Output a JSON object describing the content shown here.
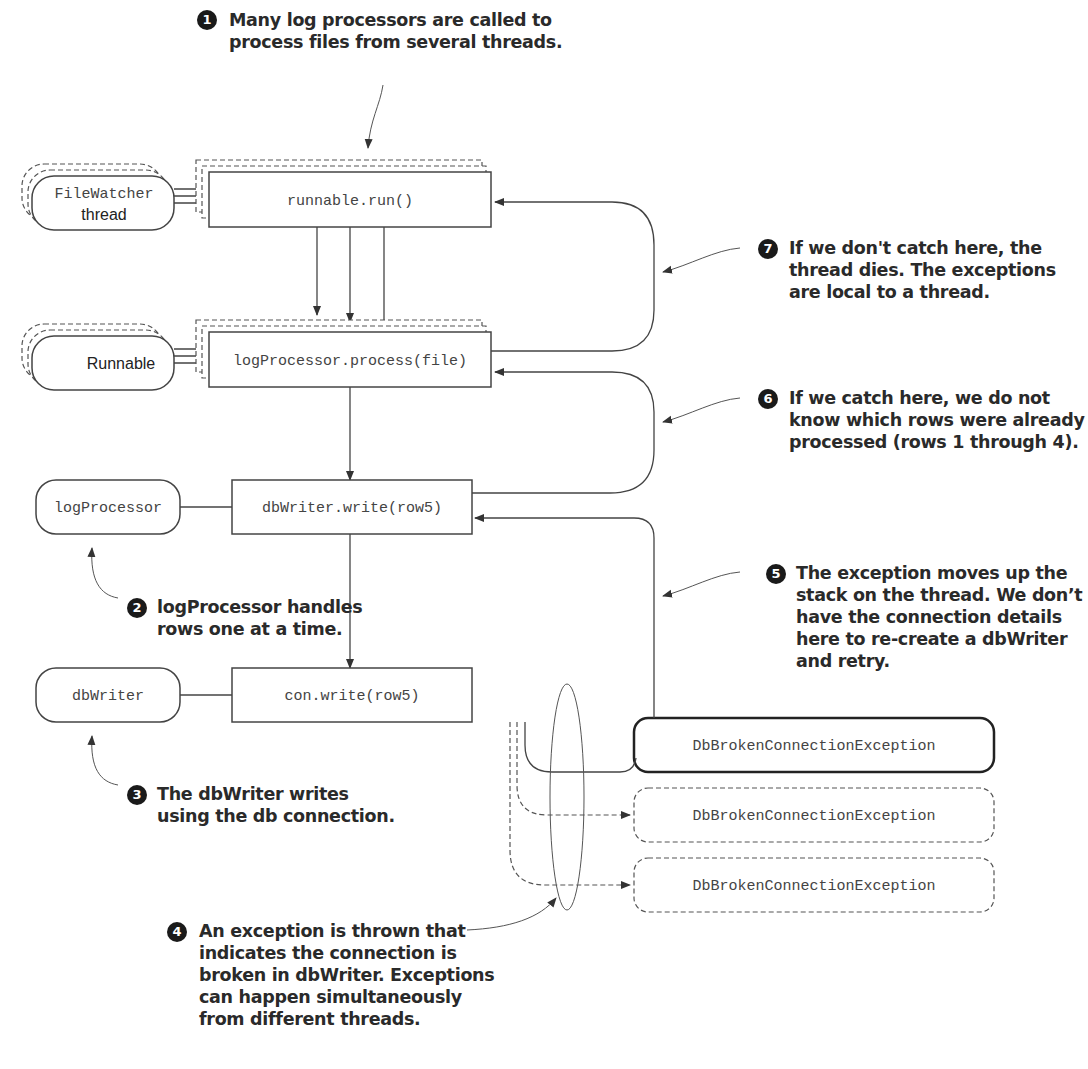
{
  "nodes": {
    "filewatcher": {
      "line1": "FileWatcher",
      "line2": "thread"
    },
    "runnable": "Runnable",
    "logprocessor": "logProcessor",
    "dbwriter": "dbWriter",
    "run_call": "runnable.run()",
    "process_call": "logProcessor.process(file)",
    "write_call": "dbWriter.write(row5)",
    "con_write_call": "con.write(row5)",
    "exceptions": [
      "DbBrokenConnectionException",
      "DbBrokenConnectionException",
      "DbBrokenConnectionException"
    ]
  },
  "annotations": [
    {
      "num": "1",
      "lines": [
        "Many log processors are called to",
        "process files from several threads."
      ]
    },
    {
      "num": "2",
      "lines": [
        "logProcessor handles",
        "rows one at a time."
      ]
    },
    {
      "num": "3",
      "lines": [
        "The dbWriter writes",
        "using the db connection."
      ]
    },
    {
      "num": "4",
      "lines": [
        "An exception is thrown that",
        "indicates the connection is",
        "broken in dbWriter. Exceptions",
        "can happen simultaneously",
        "from different threads."
      ]
    },
    {
      "num": "5",
      "lines": [
        "The exception moves up the",
        "stack on the thread.  We don’t",
        "have the connection details",
        "here to re-create a dbWriter",
        "and retry."
      ]
    },
    {
      "num": "6",
      "lines": [
        "If we catch here, we do not",
        "know which rows were already",
        "processed (rows 1 through 4)."
      ]
    },
    {
      "num": "7",
      "lines": [
        "If we don't catch here, the",
        "thread dies. The exceptions",
        "are local to a thread."
      ]
    }
  ]
}
